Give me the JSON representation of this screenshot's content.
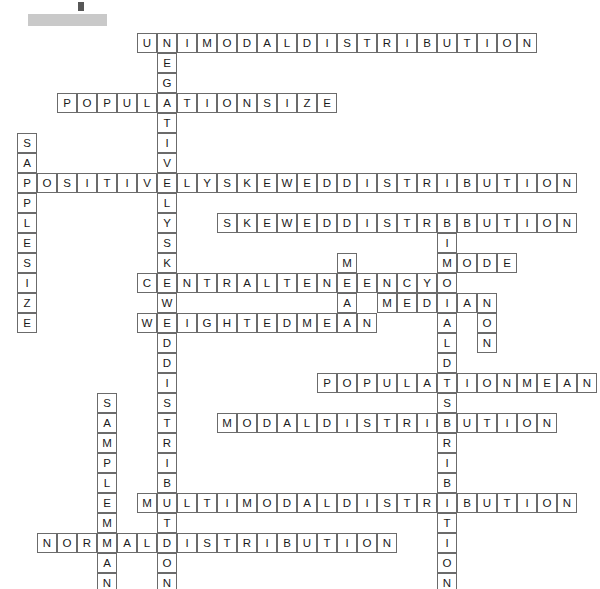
{
  "page": {
    "kind": "crossword-puzzle",
    "title": "",
    "background_color": "#ffffff",
    "cell_border_color": "#6b6b6b",
    "letter_color": "#1a1a1a",
    "redaction_color": "#c9c9c9"
  },
  "grid": {
    "cell_size": 20,
    "origin_x": 17,
    "origin_y": 33,
    "columns": 29,
    "rows": 28
  },
  "entries": [
    {
      "answer": "UNIMODALDISTRIBUTION",
      "direction": "across",
      "row": 0,
      "col": 6,
      "length": 20
    },
    {
      "answer": "NEGATIVELYSKEWEDDISTRIBUTION",
      "direction": "down",
      "row": 0,
      "col": 7,
      "length": 28
    },
    {
      "answer": "POPULATIONSIZE",
      "direction": "across",
      "row": 3,
      "col": 2,
      "length": 14
    },
    {
      "answer": "SAMPLESIZE",
      "direction": "down",
      "row": 5,
      "col": 0,
      "length": 10
    },
    {
      "answer": "POSITIVELYSKEWEDDISTRIBUTION",
      "direction": "across",
      "row": 7,
      "col": 0,
      "length": 28
    },
    {
      "answer": "SKEWEDDISTRIBUTION",
      "direction": "across",
      "row": 9,
      "col": 10,
      "length": 18
    },
    {
      "answer": "BIMODALDISTRIBUTION",
      "direction": "down",
      "row": 9,
      "col": 21,
      "length": 19
    },
    {
      "answer": "MODE",
      "direction": "across",
      "row": 11,
      "col": 21,
      "length": 4
    },
    {
      "answer": "CENTRALTENDENCY",
      "direction": "across",
      "row": 12,
      "col": 6,
      "length": 15
    },
    {
      "answer": "MEAN",
      "direction": "down",
      "row": 11,
      "col": 16,
      "length": 4
    },
    {
      "answer": "MEDIAN",
      "direction": "across",
      "row": 13,
      "col": 18,
      "length": 6
    },
    {
      "answer": "NON",
      "direction": "down",
      "row": 13,
      "col": 23,
      "length": 3
    },
    {
      "answer": "WEIGHTEDMEAN",
      "direction": "across",
      "row": 14,
      "col": 6,
      "length": 12
    },
    {
      "answer": "POPULATIONMEAN",
      "direction": "across",
      "row": 17,
      "col": 15,
      "length": 14
    },
    {
      "answer": "SAMPLEMEAN",
      "direction": "down",
      "row": 18,
      "col": 4,
      "length": 10
    },
    {
      "answer": "MODALDISTRIBUTION",
      "direction": "across",
      "row": 19,
      "col": 10,
      "length": 17
    },
    {
      "answer": "MULTIMODALDISTRIBUTION",
      "direction": "across",
      "row": 23,
      "col": 6,
      "length": 22
    },
    {
      "answer": "NORMALDISTRIBUTION",
      "direction": "across",
      "row": 25,
      "col": 1,
      "length": 18
    }
  ]
}
